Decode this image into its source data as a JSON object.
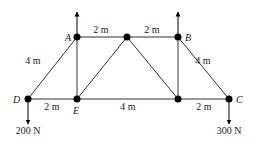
{
  "diagram": {
    "type": "truss",
    "colors": {
      "line": "#333333",
      "node": "#000000",
      "text": "#222222"
    },
    "nodes": [
      {
        "id": "D",
        "label": "D",
        "x": 28,
        "y": 99,
        "labelX": 13,
        "labelY": 103
      },
      {
        "id": "E",
        "label": "E",
        "x": 77,
        "y": 99,
        "labelX": 73,
        "labelY": 114
      },
      {
        "id": "F",
        "label": "",
        "x": 178,
        "y": 99
      },
      {
        "id": "C",
        "label": "C",
        "x": 229,
        "y": 99,
        "labelX": 236,
        "labelY": 103
      },
      {
        "id": "A",
        "label": "A",
        "x": 77,
        "y": 37,
        "labelX": 65,
        "labelY": 41
      },
      {
        "id": "G",
        "label": "",
        "x": 127,
        "y": 37
      },
      {
        "id": "B",
        "label": "B",
        "x": 178,
        "y": 37,
        "labelX": 185,
        "labelY": 41
      }
    ],
    "members": [
      [
        "D",
        "E"
      ],
      [
        "E",
        "F"
      ],
      [
        "F",
        "C"
      ],
      [
        "A",
        "G"
      ],
      [
        "G",
        "B"
      ],
      [
        "D",
        "A"
      ],
      [
        "A",
        "E"
      ],
      [
        "E",
        "G"
      ],
      [
        "G",
        "F"
      ],
      [
        "F",
        "B"
      ],
      [
        "B",
        "C"
      ]
    ],
    "dimensions": [
      {
        "text": "2 m",
        "x": 101,
        "y": 33
      },
      {
        "text": "2 m",
        "x": 152,
        "y": 33
      },
      {
        "text": "4 m",
        "x": 33,
        "y": 64
      },
      {
        "text": "4 m",
        "x": 203,
        "y": 64
      },
      {
        "text": "2 m",
        "x": 52,
        "y": 110
      },
      {
        "text": "4 m",
        "x": 128,
        "y": 110
      },
      {
        "text": "2 m",
        "x": 204,
        "y": 110
      }
    ],
    "loads": [
      {
        "node": "A",
        "direction": "up",
        "x": 77,
        "y1": 37,
        "y2": 12,
        "text": ""
      },
      {
        "node": "B",
        "direction": "up",
        "x": 178,
        "y1": 37,
        "y2": 12,
        "text": ""
      },
      {
        "node": "D",
        "direction": "down",
        "x": 28,
        "y1": 99,
        "y2": 124,
        "text": "200 N",
        "textX": 28,
        "textY": 134
      },
      {
        "node": "C",
        "direction": "down",
        "x": 229,
        "y1": 99,
        "y2": 124,
        "text": "300 N",
        "textX": 229,
        "textY": 134
      }
    ]
  }
}
